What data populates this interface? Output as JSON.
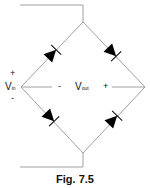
{
  "diagram": {
    "type": "bridge-rectifier",
    "caption": "Fig. 7.5",
    "input_label": {
      "main": "V",
      "sub": "in",
      "plus": "+",
      "minus": "-"
    },
    "output_label": {
      "main": "V",
      "sub": "out",
      "minus": "-",
      "plus": "+"
    },
    "components": [
      "diode-top-left",
      "diode-top-right",
      "diode-bottom-left",
      "diode-bottom-right"
    ],
    "colors": {
      "wire": "#a0a0a0",
      "diode": "#000000",
      "text": "#111111"
    }
  }
}
